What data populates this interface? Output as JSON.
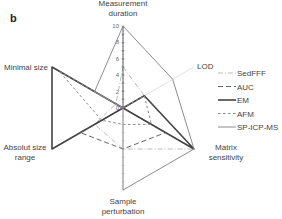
{
  "panel_label": "b",
  "chart_data": {
    "type": "radar",
    "title": "",
    "axes": [
      "Measurement duration",
      "LOD",
      "Matrix sensitivity",
      "Sample perturbation",
      "Absolut size range",
      "Minimal size"
    ],
    "axis_labels": [
      [
        "Measurement",
        "duration"
      ],
      [
        "LOD"
      ],
      [
        "Matrix",
        "sensitivity"
      ],
      [
        "Sample",
        "perturbation"
      ],
      [
        "Absolut size",
        "range"
      ],
      [
        "Minimal size"
      ]
    ],
    "ticks": [
      "0",
      "2",
      "4",
      "6",
      "8",
      "10"
    ],
    "range": [
      0,
      10
    ],
    "legend_position": "right",
    "series": [
      {
        "name": "SedFFF",
        "style": "dashdot",
        "color": "#bbbbbb",
        "width": 1,
        "values": [
          5,
          3,
          10,
          5,
          4,
          1
        ]
      },
      {
        "name": "AUC",
        "style": "dashed",
        "color": "#666666",
        "width": 1,
        "values": [
          10,
          0,
          6,
          5,
          6,
          0
        ]
      },
      {
        "name": "EM",
        "style": "solid",
        "color": "#444444",
        "width": 1.6,
        "values": [
          0,
          3,
          10,
          0,
          10,
          10
        ]
      },
      {
        "name": "AFM",
        "style": "shortdash",
        "color": "#888888",
        "width": 1,
        "values": [
          0,
          3,
          4,
          2,
          3,
          9
        ]
      },
      {
        "name": "SP-ICP-MS",
        "style": "solid",
        "color": "#8c8c8c",
        "width": 1,
        "values": [
          10,
          7,
          10,
          10,
          0,
          4
        ]
      }
    ]
  }
}
